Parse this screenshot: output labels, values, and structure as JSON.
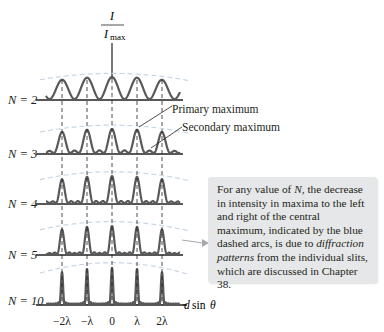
{
  "figure": {
    "axis_label": {
      "numerator": "I",
      "denominator": "I",
      "denominator_sub": "max"
    },
    "x_axis_label": {
      "d": "d",
      "sin": "sin",
      "theta": "θ"
    },
    "x_ticks": [
      "−2λ",
      "−λ",
      "0",
      "λ",
      "2λ"
    ],
    "rows": [
      {
        "N": "2",
        "label": "N = 2"
      },
      {
        "N": "3",
        "label": "N = 3"
      },
      {
        "N": "4",
        "label": "N = 4"
      },
      {
        "N": "5",
        "label": "N = 5"
      },
      {
        "N": "10",
        "label": "N = 10"
      }
    ],
    "annotations": {
      "primary": "Primary maximum",
      "secondary": "Secondary maximum"
    },
    "note": {
      "text_before": "For any value of ",
      "N": "N",
      "text_mid": ", the decrease in intensity in maxima to the left and right of the central maximum, indicated by the blue dashed arcs, is due to ",
      "em": "diffraction patterns",
      "text_after": " from the individual slits, which are discussed in Chapter 38."
    },
    "colors": {
      "curve": "#58595b",
      "axis": "#231f20",
      "arc": "#c7d7e6",
      "note_bg": "#e6e7e8"
    }
  }
}
